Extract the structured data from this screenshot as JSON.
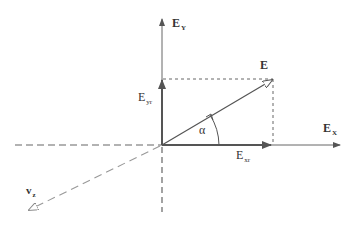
{
  "diagram": {
    "title": "",
    "colors": {
      "axis": "#555555",
      "vector": "#555555",
      "projection_dotted": "#666666",
      "vz_dashed": "#999999",
      "text": "#333333"
    },
    "origin": {
      "x": 162,
      "y": 145
    },
    "labels": {
      "ey": {
        "main": "E",
        "sub": "Y"
      },
      "ex": {
        "main": "E",
        "sub": "X"
      },
      "e": {
        "main": "E"
      },
      "eyr": {
        "main": "E",
        "sub": "yr"
      },
      "exr": {
        "main": "E",
        "sub": "xr"
      },
      "alpha": {
        "main": "α"
      },
      "vz": {
        "main": "v",
        "sub": "z"
      }
    },
    "elements": [
      {
        "id": "y-axis",
        "type": "arrow",
        "style": "solid",
        "from": [
          162,
          145
        ],
        "to": [
          162,
          18
        ],
        "label": "E_Y"
      },
      {
        "id": "x-axis",
        "type": "arrow",
        "style": "solid",
        "from": [
          162,
          145
        ],
        "to": [
          340,
          145
        ],
        "label": "E_X"
      },
      {
        "id": "neg-x-axis",
        "type": "line",
        "style": "dashed",
        "from": [
          15,
          145
        ],
        "to": [
          162,
          145
        ]
      },
      {
        "id": "neg-y-axis",
        "type": "line",
        "style": "dashed",
        "from": [
          162,
          145
        ],
        "to": [
          162,
          212
        ]
      },
      {
        "id": "vz-axis",
        "type": "arrow",
        "style": "dashed",
        "from": [
          162,
          145
        ],
        "to": [
          28,
          211
        ],
        "label": "v_z"
      },
      {
        "id": "e-vector",
        "type": "arrow",
        "style": "solid",
        "from": [
          162,
          145
        ],
        "to": [
          273,
          79
        ],
        "label": "E"
      },
      {
        "id": "eyr-component",
        "type": "arrow",
        "style": "solid-thick",
        "from": [
          162,
          145
        ],
        "to": [
          162,
          79
        ],
        "label": "E_yr"
      },
      {
        "id": "exr-component",
        "type": "arrow",
        "style": "solid-thick",
        "from": [
          162,
          145
        ],
        "to": [
          273,
          145
        ],
        "label": "E_xr"
      },
      {
        "id": "top-projection",
        "type": "line",
        "style": "dotted",
        "from": [
          162,
          79
        ],
        "to": [
          273,
          79
        ]
      },
      {
        "id": "right-projection",
        "type": "line",
        "style": "dotted",
        "from": [
          273,
          79
        ],
        "to": [
          273,
          145
        ]
      },
      {
        "id": "alpha-arc",
        "type": "arc",
        "style": "solid",
        "center": [
          162,
          145
        ],
        "radius": 57,
        "label": "α"
      }
    ]
  }
}
